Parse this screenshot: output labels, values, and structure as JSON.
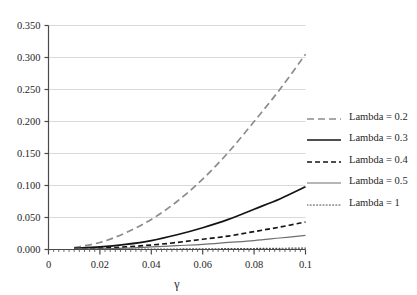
{
  "chart_data": {
    "type": "line",
    "title": "",
    "subtitle": "",
    "xlabel": "γ",
    "ylabel": "",
    "xlim": [
      0,
      0.1
    ],
    "ylim": [
      0,
      0.35
    ],
    "grid": true,
    "grid_axis": "y",
    "legend_position": "right",
    "x_tick_labels": [
      "0",
      "0.02",
      "0.04",
      "0.06",
      "0.08",
      "0.1"
    ],
    "x_tick_values": [
      0,
      0.02,
      0.04,
      0.06,
      0.08,
      0.1
    ],
    "x_minor_tick_step": 0.002,
    "y_tick_labels": [
      "0.000",
      "0.050",
      "0.100",
      "0.150",
      "0.200",
      "0.250",
      "0.300",
      "0.350"
    ],
    "y_tick_values": [
      0,
      0.05,
      0.1,
      0.15,
      0.2,
      0.25,
      0.3,
      0.35
    ],
    "x": [
      0.01,
      0.02,
      0.03,
      0.04,
      0.05,
      0.06,
      0.07,
      0.08,
      0.09,
      0.1
    ],
    "series": [
      {
        "name": "Lambda = 0.2",
        "style": "dashed",
        "color": "#8c8c8c",
        "width": 1.7,
        "dasharray": "7,4",
        "values": [
          0.003,
          0.011,
          0.026,
          0.047,
          0.075,
          0.11,
          0.152,
          0.2,
          0.25,
          0.305
        ]
      },
      {
        "name": "Lambda = 0.3",
        "style": "solid",
        "color": "#141414",
        "width": 1.7,
        "dasharray": "",
        "values": [
          0.002,
          0.004,
          0.008,
          0.014,
          0.023,
          0.034,
          0.047,
          0.063,
          0.079,
          0.098
        ]
      },
      {
        "name": "Lambda = 0.4",
        "style": "dashed",
        "color": "#141414",
        "width": 1.7,
        "dasharray": "5,3",
        "values": [
          0.001,
          0.002,
          0.004,
          0.007,
          0.011,
          0.016,
          0.021,
          0.028,
          0.035,
          0.043
        ]
      },
      {
        "name": "Lambda = 0.5",
        "style": "solid",
        "color": "#6e6e6e",
        "width": 1.2,
        "dasharray": "",
        "values": [
          0.001,
          0.001,
          0.002,
          0.004,
          0.006,
          0.008,
          0.011,
          0.014,
          0.018,
          0.022
        ]
      },
      {
        "name": "Lambda = 1",
        "style": "dotted",
        "color": "#4d4d4d",
        "width": 1.2,
        "dasharray": "1,2.2",
        "values": [
          0.0002,
          0.0003,
          0.0004,
          0.0006,
          0.0008,
          0.001,
          0.0013,
          0.0016,
          0.0019,
          0.0022
        ]
      }
    ]
  },
  "legend": {
    "entries": [
      {
        "label": "Lambda = 0.2"
      },
      {
        "label": "Lambda = 0.3"
      },
      {
        "label": "Lambda = 0.4"
      },
      {
        "label": "Lambda = 0.5"
      },
      {
        "label": "Lambda = 1"
      }
    ]
  },
  "colors": {
    "gridline": "#d9d9d9",
    "axis": "#4a4a4a",
    "text": "#1f1f1f",
    "background": "#ffffff"
  }
}
